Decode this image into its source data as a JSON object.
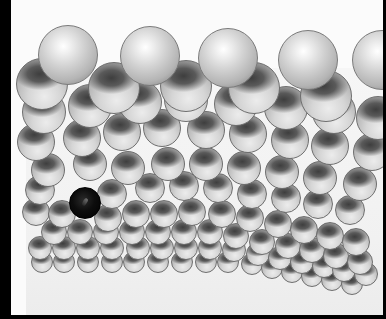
{
  "image": {
    "description": "Grayscale photograph of a crystal lattice model made of reflective metal spheres, with one dark (black) sphere representing a defect/vacancy site",
    "width": 386,
    "height": 319,
    "colors": {
      "border": "#000000",
      "background": "#fbfbfb",
      "sphere_light": "#d2d2d2",
      "sphere_shadow": "#3e3e3e",
      "defect_sphere": "#0d0d0d"
    }
  },
  "lattice": {
    "rows": [
      {
        "layer": "r10",
        "type": "mirror",
        "r": 11,
        "spheres": [
          [
            42,
            262
          ],
          [
            64,
            262
          ],
          [
            88,
            262
          ],
          [
            112,
            262
          ],
          [
            134,
            262
          ],
          [
            158,
            262
          ],
          [
            182,
            262
          ],
          [
            206,
            262
          ],
          [
            228,
            262
          ],
          [
            252,
            264
          ],
          [
            272,
            268
          ],
          [
            292,
            272
          ],
          [
            312,
            276
          ],
          [
            332,
            280
          ],
          [
            352,
            284
          ]
        ]
      },
      {
        "layer": "r9",
        "type": "mirror",
        "r": 12,
        "spheres": [
          [
            40,
            248
          ],
          [
            64,
            248
          ],
          [
            88,
            248
          ],
          [
            112,
            248
          ],
          [
            138,
            248
          ],
          [
            162,
            248
          ],
          [
            186,
            248
          ],
          [
            210,
            248
          ],
          [
            234,
            250
          ],
          [
            258,
            254
          ],
          [
            280,
            258
          ],
          [
            302,
            262
          ],
          [
            324,
            266
          ],
          [
            344,
            270
          ],
          [
            366,
            274
          ]
        ]
      },
      {
        "layer": "r8",
        "type": "mirror",
        "r": 13,
        "spheres": [
          [
            54,
            232
          ],
          [
            80,
            232
          ],
          [
            106,
            232
          ],
          [
            132,
            232
          ],
          [
            158,
            232
          ],
          [
            184,
            232
          ],
          [
            210,
            232
          ],
          [
            236,
            236
          ],
          [
            262,
            242
          ],
          [
            288,
            246
          ],
          [
            312,
            250
          ],
          [
            336,
            256
          ],
          [
            360,
            262
          ]
        ]
      },
      {
        "layer": "r7",
        "type": "mirror",
        "r": 14,
        "spheres": [
          [
            36,
            212
          ],
          [
            62,
            214
          ],
          [
            108,
            218
          ],
          [
            136,
            214
          ],
          [
            164,
            214
          ],
          [
            192,
            212
          ],
          [
            222,
            214
          ],
          [
            250,
            218
          ],
          [
            278,
            224
          ],
          [
            304,
            230
          ],
          [
            330,
            236
          ],
          [
            356,
            242
          ]
        ]
      },
      {
        "layer": "r6",
        "type": "mirror",
        "r": 15,
        "spheres": [
          [
            40,
            190
          ],
          [
            112,
            194
          ],
          [
            150,
            188
          ],
          [
            184,
            186
          ],
          [
            218,
            188
          ],
          [
            252,
            194
          ],
          [
            286,
            198
          ],
          [
            318,
            204
          ],
          [
            350,
            210
          ]
        ]
      },
      {
        "layer": "r5",
        "type": "mirror",
        "r": 17,
        "spheres": [
          [
            48,
            170
          ],
          [
            90,
            164
          ],
          [
            128,
            168
          ],
          [
            168,
            164
          ],
          [
            206,
            164
          ],
          [
            244,
            168
          ],
          [
            282,
            172
          ],
          [
            320,
            178
          ],
          [
            360,
            184
          ]
        ]
      },
      {
        "layer": "r4",
        "type": "mirror",
        "r": 19,
        "spheres": [
          [
            36,
            142
          ],
          [
            82,
            138
          ],
          [
            122,
            132
          ],
          [
            162,
            128
          ],
          [
            206,
            130
          ],
          [
            248,
            134
          ],
          [
            290,
            140
          ],
          [
            330,
            146
          ],
          [
            372,
            152
          ]
        ]
      },
      {
        "layer": "r3",
        "type": "mirror",
        "r": 22,
        "spheres": [
          [
            44,
            112
          ],
          [
            90,
            106
          ],
          [
            140,
            102
          ],
          [
            186,
            100
          ],
          [
            236,
            104
          ],
          [
            286,
            108
          ],
          [
            334,
            112
          ],
          [
            378,
            118
          ]
        ]
      },
      {
        "layer": "r2",
        "type": "mirror",
        "r": 26,
        "spheres": [
          [
            42,
            84
          ],
          [
            114,
            88
          ],
          [
            186,
            86
          ],
          [
            254,
            88
          ],
          [
            326,
            96
          ]
        ]
      },
      {
        "layer": "r1",
        "type": "top",
        "r": 30,
        "spheres": [
          [
            68,
            55
          ],
          [
            150,
            56
          ],
          [
            228,
            58
          ],
          [
            308,
            60
          ],
          [
            382,
            60
          ]
        ]
      }
    ],
    "defect": {
      "type": "defect",
      "x": 85,
      "y": 203,
      "r": 16
    }
  }
}
